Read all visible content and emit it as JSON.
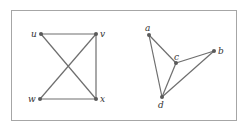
{
  "figure": {
    "graphs": [
      {
        "id": "left-graph",
        "nodes": [
          {
            "id": "u",
            "label": "u",
            "x": 41,
            "y": 34,
            "lx": 31,
            "ly": 37
          },
          {
            "id": "v",
            "label": "v",
            "x": 96,
            "y": 34,
            "lx": 100,
            "ly": 37
          },
          {
            "id": "w",
            "label": "w",
            "x": 40,
            "y": 99,
            "lx": 28,
            "ly": 102
          },
          {
            "id": "x",
            "label": "x",
            "x": 96,
            "y": 99,
            "lx": 100,
            "ly": 102
          }
        ],
        "edges": [
          [
            "u",
            "v"
          ],
          [
            "u",
            "x"
          ],
          [
            "v",
            "w"
          ],
          [
            "v",
            "x"
          ],
          [
            "w",
            "x"
          ]
        ]
      },
      {
        "id": "right-graph",
        "nodes": [
          {
            "id": "a",
            "label": "a",
            "x": 149,
            "y": 35,
            "lx": 145,
            "ly": 31
          },
          {
            "id": "b",
            "label": "b",
            "x": 214,
            "y": 51,
            "lx": 218,
            "ly": 54
          },
          {
            "id": "c",
            "label": "c",
            "x": 176,
            "y": 63,
            "lx": 174,
            "ly": 60
          },
          {
            "id": "d",
            "label": "d",
            "x": 162,
            "y": 97,
            "lx": 158,
            "ly": 108
          }
        ],
        "edges": [
          [
            "a",
            "c"
          ],
          [
            "a",
            "d"
          ],
          [
            "c",
            "b"
          ],
          [
            "c",
            "d"
          ],
          [
            "b",
            "d"
          ]
        ]
      }
    ],
    "colors": {
      "edge": "#6e6e6e",
      "node": "#5a5a5a",
      "frame": "#a6a6a6",
      "label": "#333333"
    }
  }
}
